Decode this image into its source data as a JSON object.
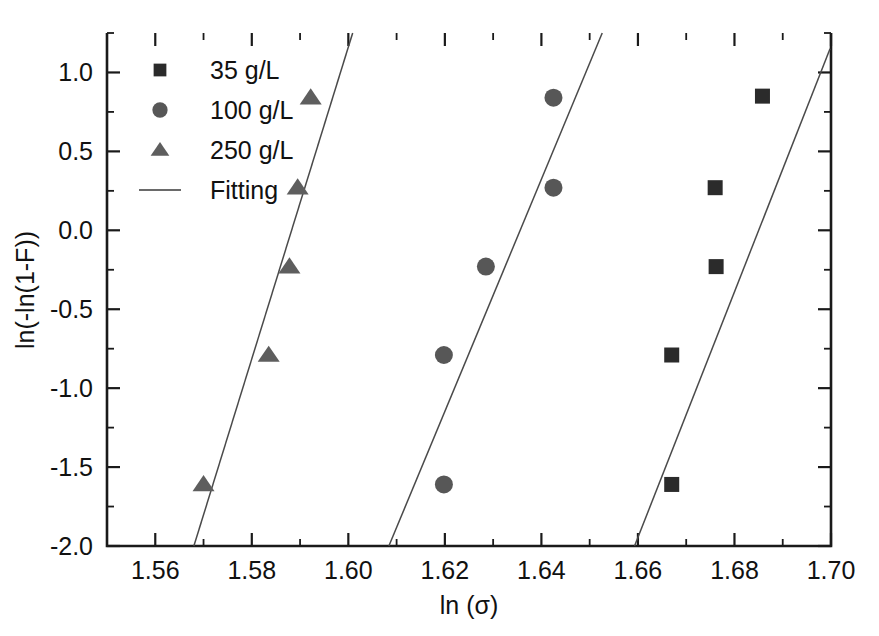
{
  "chart_data": {
    "type": "scatter",
    "title": "",
    "xlabel": "ln (σ)",
    "ylabel": "ln(-ln(1-F))",
    "xlim": [
      1.55,
      1.7
    ],
    "ylim": [
      -2.0,
      1.25
    ],
    "grid": false,
    "legend_position": "top-left",
    "x_ticks": [
      "1.56",
      "1.58",
      "1.60",
      "1.62",
      "1.64",
      "1.66",
      "1.68",
      "1.70"
    ],
    "x_tick_values": [
      1.56,
      1.58,
      1.6,
      1.62,
      1.64,
      1.66,
      1.68,
      1.7
    ],
    "x_minor_step": 0.01,
    "y_ticks": [
      "1.0",
      "0.5",
      "0.0",
      "-0.5",
      "-1.0",
      "-1.5",
      "-2.0"
    ],
    "y_tick_values": [
      1.0,
      0.5,
      0.0,
      -0.5,
      -1.0,
      -1.5,
      -2.0
    ],
    "y_minor_step": 0.25,
    "series": [
      {
        "name": "35 g/L",
        "marker": "square",
        "color": "#2b2b2b",
        "points": [
          {
            "x": 1.667,
            "y": -1.61
          },
          {
            "x": 1.667,
            "y": -0.79
          },
          {
            "x": 1.6762,
            "y": -0.23
          },
          {
            "x": 1.676,
            "y": 0.27
          },
          {
            "x": 1.6858,
            "y": 0.85
          }
        ]
      },
      {
        "name": "100 g/L",
        "marker": "circle",
        "color": "#575757",
        "points": [
          {
            "x": 1.6198,
            "y": -1.61
          },
          {
            "x": 1.6198,
            "y": -0.79
          },
          {
            "x": 1.6285,
            "y": -0.23
          },
          {
            "x": 1.6425,
            "y": 0.27
          },
          {
            "x": 1.6425,
            "y": 0.84
          }
        ]
      },
      {
        "name": "250 g/L",
        "marker": "triangle",
        "color": "#5e5e5e",
        "points": [
          {
            "x": 1.57,
            "y": -1.61
          },
          {
            "x": 1.5835,
            "y": -0.79
          },
          {
            "x": 1.5878,
            "y": -0.23
          },
          {
            "x": 1.5895,
            "y": 0.27
          },
          {
            "x": 1.5922,
            "y": 0.84
          }
        ]
      }
    ],
    "fits": [
      {
        "name": "Fitting 250 g/L",
        "x1": 1.568,
        "y1": -2.0,
        "x2": 1.6009,
        "y2": 1.25
      },
      {
        "name": "Fitting 100 g/L",
        "x1": 1.6084,
        "y1": -2.0,
        "x2": 1.6526,
        "y2": 1.25
      },
      {
        "name": "Fitting 35 g/L",
        "x1": 1.6593,
        "y1": -2.0,
        "x2": 1.6998,
        "y2": 1.15
      }
    ]
  },
  "legend": {
    "entries": [
      {
        "label": "35 g/L",
        "marker": "square"
      },
      {
        "label": "100 g/L",
        "marker": "circle"
      },
      {
        "label": "250 g/L",
        "marker": "triangle"
      },
      {
        "label": "Fitting",
        "marker": "line"
      }
    ]
  },
  "axes": {
    "x_title": "ln (σ)",
    "y_title": "ln(-ln(1-F))"
  }
}
